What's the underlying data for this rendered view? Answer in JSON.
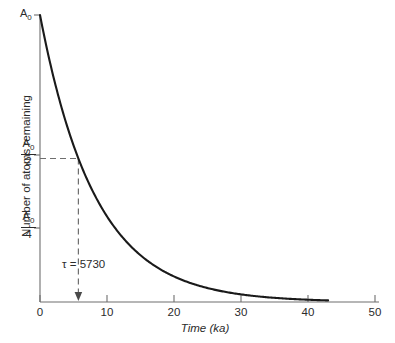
{
  "chart_data": {
    "type": "line",
    "title": "",
    "xlabel": "Time (ka)",
    "ylabel": "Number of atoms remaining",
    "xlim": [
      0,
      50
    ],
    "ylim": [
      0,
      1
    ],
    "grid": false,
    "legend": "none",
    "x_ticks": [
      "0",
      "10",
      "20",
      "30",
      "40",
      "50"
    ],
    "x_tick_values": [
      0,
      10,
      20,
      30,
      40,
      50
    ],
    "y_ticks": [
      "A0",
      "A0/2",
      "A0/4"
    ],
    "y_tick_values": [
      1,
      0.5,
      0.25
    ],
    "curve_domain": [
      0,
      43
    ],
    "decay_constant_ka": 5.73,
    "model": "A = A0 * 2^(-t/5.73)",
    "series": [
      {
        "name": "Atoms remaining",
        "x": [
          0,
          2,
          4,
          5.73,
          8,
          10,
          12,
          14,
          16,
          18,
          20,
          23,
          26,
          29,
          32,
          35,
          38,
          41,
          43
        ],
        "y": [
          1.0,
          0.785,
          0.617,
          0.5,
          0.379,
          0.299,
          0.236,
          0.185,
          0.146,
          0.115,
          0.091,
          0.063,
          0.044,
          0.031,
          0.021,
          0.015,
          0.01,
          0.007,
          0.006
        ]
      }
    ],
    "annotations": [
      {
        "name": "half-life-marker",
        "text": "τ = 5730",
        "x": 5.73,
        "y": 0.5
      }
    ]
  },
  "labels": {
    "y_axis_title": "Number of atoms remaining",
    "x_axis_title": "Time (ka)",
    "a0_top": "A",
    "a0_top_sub": "0",
    "half_num": "A",
    "half_num_sub": "0",
    "half_den": "2",
    "quarter_num": "A",
    "quarter_num_sub": "0",
    "quarter_den": "4",
    "tau_text": "τ = 5730",
    "xtick_0": "0",
    "xtick_10": "10",
    "xtick_20": "20",
    "xtick_30": "30",
    "xtick_40": "40",
    "xtick_50": "50"
  },
  "colors": {
    "curve": "#1a1a1a",
    "axis": "#6e6e6e",
    "text": "#2b2b2b",
    "dashed": "#6e6e6e",
    "background": "#ffffff"
  }
}
